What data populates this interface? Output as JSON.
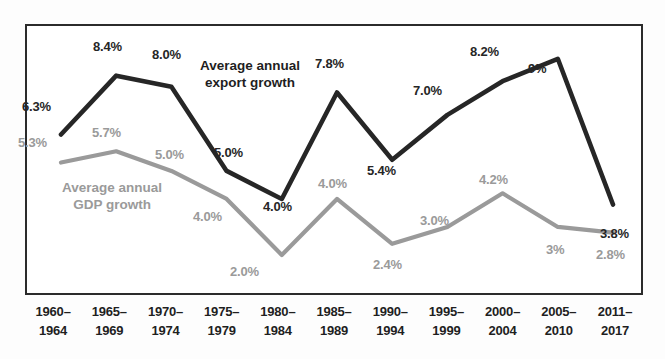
{
  "chart_data": {
    "type": "line",
    "title": "",
    "subtitle": "",
    "xlabel": "",
    "ylabel": "",
    "grid": false,
    "legend_position": "inline-annotation",
    "ylim": [
      1.5,
      9.6
    ],
    "categories": [
      "1960–1964",
      "1965–1969",
      "1970–1974",
      "1975–1979",
      "1980–1984",
      "1985–1989",
      "1990–1994",
      "1995–1999",
      "2000–2004",
      "2005–2010",
      "2011–2017"
    ],
    "series": [
      {
        "name": "Average annual export growth",
        "color": "#262626",
        "values": [
          6.3,
          8.4,
          8.0,
          5.0,
          4.0,
          7.8,
          5.4,
          7.0,
          8.2,
          9.0,
          3.8
        ],
        "labels": [
          "6.3%",
          "8.4%",
          "8.0%",
          "5.0%",
          "4.0%",
          "7.8%",
          "5.4%",
          "7.0%",
          "8.2%",
          "9%",
          "3.8%"
        ]
      },
      {
        "name": "Average annual GDP growth",
        "color": "#9a9a9a",
        "values": [
          5.3,
          5.7,
          5.0,
          4.0,
          2.0,
          4.0,
          2.4,
          3.0,
          4.2,
          3.0,
          2.8
        ],
        "labels": [
          "5.3%",
          "5.7%",
          "5.0%",
          "4.0%",
          "2.0%",
          "4.0%",
          "2.4%",
          "3.0%",
          "4.2%",
          "3%",
          "2.8%"
        ]
      }
    ],
    "annotations": [
      {
        "id": "export-annot",
        "line1": "Average annual",
        "line2": "export growth",
        "series": "Average annual export growth"
      },
      {
        "id": "gdp-annot",
        "line1": "Average annual",
        "line2": "GDP growth",
        "series": "Average annual GDP growth"
      }
    ]
  },
  "colors": {
    "export_line": "#262626",
    "gdp_line": "#9a9a9a",
    "frame": "#2b2b2b",
    "plot_background": "#ffffff",
    "page_background": "#fdfdfd"
  },
  "x_axis": {
    "ticks": [
      {
        "top": "1960–",
        "bottom": "1964"
      },
      {
        "top": "1965–",
        "bottom": "1969"
      },
      {
        "top": "1970–",
        "bottom": "1974"
      },
      {
        "top": "1975–",
        "bottom": "1979"
      },
      {
        "top": "1980–",
        "bottom": "1984"
      },
      {
        "top": "1985–",
        "bottom": "1989"
      },
      {
        "top": "1990–",
        "bottom": "1994"
      },
      {
        "top": "1995–",
        "bottom": "1999"
      },
      {
        "top": "2000–",
        "bottom": "2004"
      },
      {
        "top": "2005–",
        "bottom": "2010"
      },
      {
        "top": "2011–",
        "bottom": "2017"
      }
    ]
  },
  "point_labels": {
    "export": [
      {
        "text": "6.3%",
        "x": 22,
        "y": 100
      },
      {
        "text": "8.4%",
        "x": 93,
        "y": 40
      },
      {
        "text": "8.0%",
        "x": 152,
        "y": 48
      },
      {
        "text": "5.0%",
        "x": 214,
        "y": 146
      },
      {
        "text": "4.0%",
        "x": 263,
        "y": 200
      },
      {
        "text": "7.8%",
        "x": 315,
        "y": 57
      },
      {
        "text": "5.4%",
        "x": 367,
        "y": 164
      },
      {
        "text": "7.0%",
        "x": 413,
        "y": 84
      },
      {
        "text": "8.2%",
        "x": 470,
        "y": 45
      },
      {
        "text": "9%",
        "x": 528,
        "y": 62
      },
      {
        "text": "3.8%",
        "x": 600,
        "y": 227
      }
    ],
    "gdp": [
      {
        "text": "5.3%",
        "x": 18,
        "y": 136
      },
      {
        "text": "5.7%",
        "x": 92,
        "y": 126
      },
      {
        "text": "5.0%",
        "x": 155,
        "y": 148
      },
      {
        "text": "4.0%",
        "x": 193,
        "y": 210
      },
      {
        "text": "2.0%",
        "x": 230,
        "y": 265
      },
      {
        "text": "4.0%",
        "x": 318,
        "y": 177
      },
      {
        "text": "2.4%",
        "x": 373,
        "y": 258
      },
      {
        "text": "3.0%",
        "x": 420,
        "y": 214
      },
      {
        "text": "4.2%",
        "x": 479,
        "y": 173
      },
      {
        "text": "3%",
        "x": 546,
        "y": 243
      },
      {
        "text": "2.8%",
        "x": 596,
        "y": 248
      }
    ]
  },
  "annotation_positions": {
    "export": {
      "x": 200,
      "y": 58
    },
    "gdp": {
      "x": 62,
      "y": 180
    }
  }
}
